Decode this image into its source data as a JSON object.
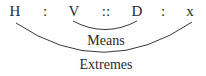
{
  "proportion": {
    "terms": [
      "H",
      ":",
      "V",
      "::",
      "D",
      ":",
      "x"
    ]
  },
  "labels": {
    "means": "Means",
    "extremes": "Extremes"
  },
  "colors": {
    "text": "#2a2a2a",
    "arc": "#3a3a3a",
    "background": "#ffffff"
  }
}
